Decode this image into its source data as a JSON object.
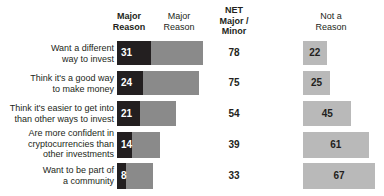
{
  "header": {
    "col_major_primary": "Major\nReason",
    "col_major_primary_line1": "Major",
    "col_major_primary_line2": "Reason",
    "col_major_secondary_line1": "Major",
    "col_major_secondary_line2": "Reason",
    "col_net_line1": "NET",
    "col_net_line2": "Major /",
    "col_net_line3": "Minor",
    "col_nota_line1": "Not a",
    "col_nota_line2": "Reason"
  },
  "colors": {
    "major": "#231f20",
    "minor": "#8a8a8a",
    "not_a_reason": "#b9b9b9",
    "text": "#231f20",
    "value_on_dark": "#ffffff",
    "background": "#ffffff"
  },
  "chart_data": {
    "type": "bar",
    "title": "",
    "xlabel": "",
    "ylabel": "",
    "orientation": "horizontal",
    "stacked": true,
    "grid": false,
    "legend": "top-column-headers",
    "xlim": [
      0,
      100
    ],
    "categories": [
      "Want a different way to invest",
      "Think it's a good way to make money",
      "Think it's easier to get into than other ways to invest",
      "Are more confident in cryptocurrencies than other investments",
      "Want to be part of a community"
    ],
    "series": [
      {
        "name": "Major Reason",
        "values": [
          31,
          24,
          21,
          14,
          8
        ]
      },
      {
        "name": "Minor Reason",
        "values": [
          47,
          51,
          33,
          25,
          25
        ]
      },
      {
        "name": "NET Major / Minor",
        "values": [
          78,
          75,
          54,
          39,
          33
        ]
      },
      {
        "name": "Not a Reason",
        "values": [
          22,
          25,
          45,
          61,
          67
        ]
      }
    ]
  },
  "rows": [
    {
      "label_lines": [
        "Want a different",
        "way to invest"
      ],
      "major": 31,
      "minor": 47,
      "net": 78,
      "not_a_reason": 22
    },
    {
      "label_lines": [
        "Think it's a good way",
        "to make money"
      ],
      "major": 24,
      "minor": 51,
      "net": 75,
      "not_a_reason": 25
    },
    {
      "label_lines": [
        "Think it's easier to get into",
        "than other ways to invest"
      ],
      "major": 21,
      "minor": 33,
      "net": 54,
      "not_a_reason": 45
    },
    {
      "label_lines": [
        "Are more confident in",
        "cryptocurrencies than",
        "other investments"
      ],
      "major": 14,
      "minor": 25,
      "net": 39,
      "not_a_reason": 61
    },
    {
      "label_lines": [
        "Want to be part of",
        "a community"
      ],
      "major": 8,
      "minor": 25,
      "net": 33,
      "not_a_reason": 67
    }
  ]
}
